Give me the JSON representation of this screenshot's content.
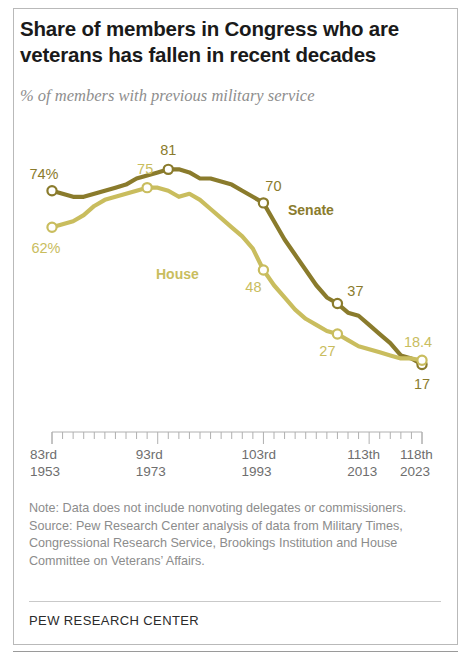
{
  "title": "Share of members in Congress who are veterans has fallen in recent decades",
  "subtitle": "% of members with previous military service",
  "footer": {
    "brand": "PEW RESEARCH CENTER"
  },
  "notes": {
    "note": "Note: Data does not include nonvoting delegates or commissioners.",
    "source": "Source: Pew Research Center analysis of data from Military Times, Congressional Research Service, Brookings Institution and House Committee on Veterans’ Affairs."
  },
  "colors": {
    "senate": "#8a7b2c",
    "house": "#c9bd5e",
    "title": "#1a1a1a",
    "subtitle": "#8e8e8e",
    "axis": "#b0b0b0",
    "note": "#8c8c8c",
    "frame": "#b9b9b9"
  },
  "chart_data": {
    "type": "line",
    "title": "Share of members in Congress who are veterans has fallen in recent decades",
    "subtitle": "% of members with previous military service",
    "xlabel": "",
    "ylabel": "% of members with previous military service",
    "ylim": [
      0,
      90
    ],
    "grid": false,
    "legend_position": "inline-labels",
    "x_tick_labels": [
      {
        "congress": "83rd",
        "year": "1953"
      },
      {
        "congress": "93rd",
        "year": "1973"
      },
      {
        "congress": "103rd",
        "year": "1993"
      },
      {
        "congress": "113th",
        "year": "2013"
      },
      {
        "congress": "118th",
        "year": "2023"
      }
    ],
    "x": [
      83,
      84,
      85,
      86,
      87,
      88,
      89,
      90,
      91,
      92,
      93,
      94,
      95,
      96,
      97,
      98,
      99,
      100,
      101,
      102,
      103,
      104,
      105,
      106,
      107,
      108,
      109,
      110,
      111,
      112,
      113,
      114,
      115,
      116,
      117,
      118
    ],
    "series": [
      {
        "name": "Senate",
        "color": "#8a7b2c",
        "values": [
          74,
          73,
          72,
          72,
          73,
          74,
          75,
          76,
          78,
          79,
          80,
          81,
          81,
          80,
          78,
          78,
          77,
          76,
          74,
          72,
          70,
          64,
          58,
          53,
          48,
          43,
          39,
          37,
          34,
          33,
          30,
          27,
          24,
          20,
          19,
          17
        ],
        "labeled_points": [
          {
            "x": 83,
            "label": "74%",
            "value": 74
          },
          {
            "x": 94,
            "label": "81",
            "value": 81
          },
          {
            "x": 103,
            "label": "70",
            "value": 70
          },
          {
            "x": 110,
            "label": "37",
            "value": 37
          },
          {
            "x": 118,
            "label": "17",
            "value": 17
          }
        ]
      },
      {
        "name": "House",
        "color": "#c9bd5e",
        "values": [
          62,
          63,
          64,
          66,
          69,
          71,
          72,
          73,
          74,
          75,
          75,
          74,
          72,
          73,
          71,
          68,
          65,
          62,
          59,
          55,
          48,
          43,
          39,
          35,
          32,
          30,
          28,
          27,
          25,
          23,
          22,
          21,
          20,
          19,
          19,
          18.4
        ],
        "labeled_points": [
          {
            "x": 83,
            "label": "62%",
            "value": 62
          },
          {
            "x": 92,
            "label": "75",
            "value": 75
          },
          {
            "x": 103,
            "label": "48",
            "value": 48
          },
          {
            "x": 110,
            "label": "27",
            "value": 27
          },
          {
            "x": 118,
            "label": "18.4",
            "value": 18.4
          }
        ]
      }
    ],
    "series_labels": [
      {
        "name": "Senate",
        "text": "Senate"
      },
      {
        "name": "House",
        "text": "House"
      }
    ]
  }
}
